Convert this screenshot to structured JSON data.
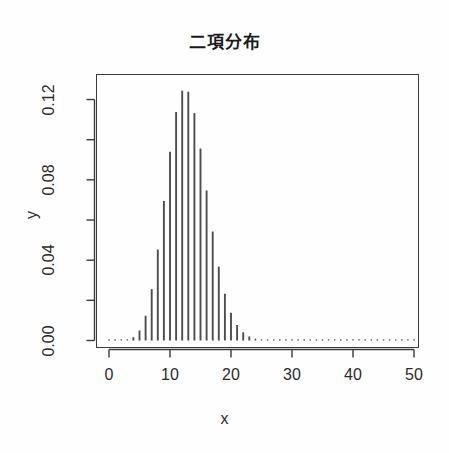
{
  "chart_data": {
    "type": "bar",
    "title": "二項分布",
    "xlabel": "x",
    "ylabel": "y",
    "grid": false,
    "legend": null,
    "xlim": [
      0,
      51
    ],
    "ylim": [
      0.0,
      0.13
    ],
    "x_ticks": [
      0,
      10,
      20,
      30,
      40,
      50
    ],
    "x_tick_labels": [
      "0",
      "10",
      "20",
      "30",
      "40",
      "50"
    ],
    "y_ticks": [
      0.0,
      0.02,
      0.04,
      0.06,
      0.08,
      0.1,
      0.12
    ],
    "y_tick_labels": [
      "0.00",
      "",
      "0.04",
      "",
      "0.08",
      "",
      "0.12"
    ],
    "y_major_labels": [
      "0.00",
      "0.04",
      "0.08",
      "0.12"
    ],
    "bar_color": "#4d4d4d",
    "axis_color": "#3a3a3a",
    "x": [
      0,
      1,
      2,
      3,
      4,
      5,
      6,
      7,
      8,
      9,
      10,
      11,
      12,
      13,
      14,
      15,
      16,
      17,
      18,
      19,
      20,
      21,
      22,
      23,
      24,
      25,
      26,
      27,
      28,
      29,
      30,
      31,
      32,
      33,
      34,
      35,
      36,
      37,
      38,
      39,
      40,
      41,
      42,
      43,
      44,
      45,
      46,
      47,
      48,
      49,
      50
    ],
    "values": [
      6e-07,
      9.5e-06,
      7.76e-05,
      0.000414,
      0.0016215,
      0.0049677,
      0.0123475,
      0.0255984,
      0.0452972,
      0.0694824,
      0.0939582,
      0.1138281,
      0.1244063,
      0.1238817,
      0.1132304,
      0.095589,
      0.0747141,
      0.0542735,
      0.0367813,
      0.0233011,
      0.013844,
      0.0077285,
      0.0040639,
      0.0020176,
      0.0009466,
      0.0004203,
      0.0001768,
      7.04e-05,
      2.65e-05,
      9.5e-06,
      3.2e-06,
      1e-06,
      3e-07,
      1e-07,
      0.0,
      0.0,
      0.0,
      0.0,
      0.0,
      0.0,
      0.0,
      0.0,
      0.0,
      0.0,
      0.0,
      0.0,
      0.0,
      0.0,
      0.0,
      0.0,
      0.0
    ],
    "distribution": "binomial",
    "n": 50,
    "p": 0.25,
    "peak_x": 12,
    "peak_value": 0.1244
  }
}
